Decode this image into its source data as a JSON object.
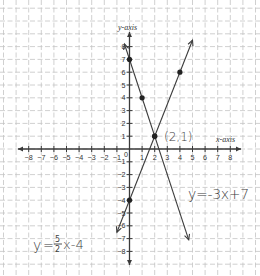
{
  "chart_data": {
    "type": "line",
    "title": "",
    "xlabel": "x-axis",
    "ylabel": "y-axis",
    "xlim": [
      -8,
      8
    ],
    "ylim": [
      -8,
      8
    ],
    "grid": true,
    "x_ticks": [
      "-8",
      "-7",
      "-6",
      "-5",
      "-4",
      "-3",
      "-2",
      "-1",
      "0",
      "1",
      "2",
      "3",
      "4",
      "5",
      "6",
      "7",
      "8"
    ],
    "y_ticks": [
      "8",
      "7",
      "6",
      "5",
      "4",
      "3",
      "2",
      "1",
      "-1",
      "-2",
      "-3",
      "-4",
      "-5",
      "-6",
      "-7",
      "-8"
    ],
    "series": [
      {
        "name": "y = 5/2 x - 4",
        "equation": "y=5/2x-4",
        "marked_points": [
          [
            0,
            -4
          ],
          [
            2,
            1
          ],
          [
            4,
            6
          ]
        ],
        "x_range": [
          -1.0,
          5.0
        ]
      },
      {
        "name": "y = -3x + 7",
        "equation": "y=-3x+7",
        "marked_points": [
          [
            0,
            7
          ],
          [
            1,
            4
          ],
          [
            2,
            1
          ]
        ],
        "x_range": [
          -0.4,
          4.7
        ]
      }
    ],
    "annotations": [
      {
        "text": "(2,1)",
        "x": 2,
        "y": 1,
        "meaning": "intersection point"
      },
      {
        "text": "y=-3x+7",
        "position": "right-lower"
      },
      {
        "text": "y=5/2x-4",
        "position": "left-lower"
      }
    ]
  },
  "labels": {
    "y_axis": "y-axis",
    "x_axis": "x-axis",
    "origin": "0",
    "intersection": "(2,1)",
    "eq1_y": "y",
    "eq1_eq": "=",
    "eq1_num": "5",
    "eq1_den": "2",
    "eq1_rest": "x-4",
    "eq2": "y=-3x+7"
  }
}
